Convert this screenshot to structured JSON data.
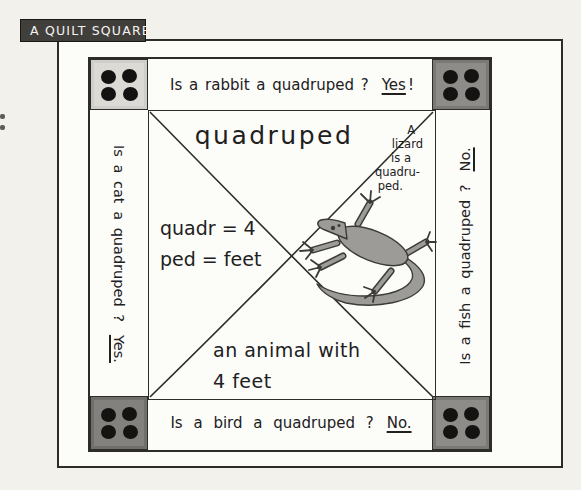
{
  "title": "A QUILT SQUARE",
  "quilt": {
    "word": "quadruped",
    "etymology": {
      "line1": "quadr = 4",
      "line2": "ped = feet"
    },
    "definition": {
      "line1": "an animal with",
      "line2": "4 feet"
    },
    "example": {
      "lines": [
        "A",
        "lizard",
        "is a",
        "quadru-",
        "ped."
      ]
    },
    "questions": {
      "top": {
        "prefix": "Is a rabbit a quadruped ?",
        "answer": "Yes",
        "suffix": "!"
      },
      "left": {
        "prefix": "Is a cat a quadruped ?",
        "answer": "Yes.",
        "suffix": ""
      },
      "right": {
        "prefix": "Is a fish a quadruped ?",
        "answer": "No.",
        "suffix": ""
      },
      "bottom": {
        "prefix": "Is a bird a quadruped ?",
        "answer": "No.",
        "suffix": ""
      }
    },
    "corner_patches": {
      "dot_count": 4,
      "icon": "four-dot-quilt-patch"
    },
    "illustration": "lizard"
  },
  "colors": {
    "page_bg": "#f2f1ec",
    "paper": "#fcfcf9",
    "line": "#2d2c29",
    "ink": "#21201d",
    "title_bg": "#413f3c",
    "title_text": "#f4f3ef",
    "corner_light": "#dbdad5",
    "corner_dark": "#8d8c88",
    "corner_dark_alt": "#82817d",
    "dot": "#141311",
    "lizard_fill": "#9c9b97",
    "lizard_line": "#3c3b38"
  }
}
